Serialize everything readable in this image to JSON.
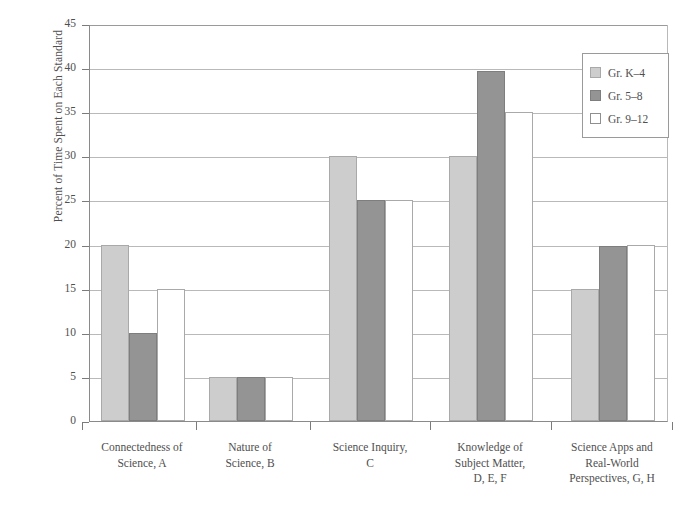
{
  "chart_data": {
    "type": "bar",
    "title": "",
    "xlabel": "",
    "ylabel": "Percent of Time Spent on Each Standard",
    "ylim": [
      0,
      45
    ],
    "ytick_values": [
      0,
      5,
      10,
      15,
      20,
      25,
      30,
      35,
      40,
      45
    ],
    "ytick_labels": [
      "0",
      "5",
      "10",
      "15",
      "20",
      "25",
      "30",
      "35",
      "40",
      "45"
    ],
    "grid": true,
    "legend_position": "top-right",
    "categories": [
      "Connectedness of\nScience, A",
      "Nature of\nScience, B",
      "Science Inquiry,\nC",
      "Knowledge of\nSubject Matter,\nD, E, F",
      "Science Apps and\nReal-World\nPerspectives, G, H"
    ],
    "series": [
      {
        "name": "Gr. K–4",
        "color": "#cdcdcd",
        "values": [
          20,
          5,
          30,
          30,
          15
        ]
      },
      {
        "name": "Gr. 5–8",
        "color": "#949494",
        "values": [
          10,
          5,
          25,
          39.7,
          19.8
        ]
      },
      {
        "name": "Gr. 9–12",
        "color": "#ffffff",
        "values": [
          15,
          5,
          25,
          35,
          20
        ]
      }
    ]
  },
  "axis": {
    "y_title": "Percent of Time Spent on Each Standard",
    "ticks": [
      {
        "label": "45"
      },
      {
        "label": "40"
      },
      {
        "label": "35"
      },
      {
        "label": "30"
      },
      {
        "label": "25"
      },
      {
        "label": "20"
      },
      {
        "label": "15"
      },
      {
        "label": "10"
      },
      {
        "label": "5"
      },
      {
        "label": "0"
      }
    ]
  },
  "x_groups": [
    {
      "lines": [
        "Connectedness of",
        "Science, A"
      ]
    },
    {
      "lines": [
        "Nature of",
        "Science, B"
      ]
    },
    {
      "lines": [
        "Science Inquiry,",
        "C"
      ]
    },
    {
      "lines": [
        "Knowledge of",
        "Subject Matter,",
        "D, E, F"
      ]
    },
    {
      "lines": [
        "Science Apps and",
        "Real-World",
        "Perspectives, G, H"
      ]
    }
  ],
  "legend": {
    "entries": [
      {
        "label": "Gr. K–4",
        "swatch": "light-gray-swatch"
      },
      {
        "label": "Gr. 5–8",
        "swatch": "dark-gray-swatch"
      },
      {
        "label": "Gr. 9–12",
        "swatch": "white-swatch"
      }
    ]
  }
}
